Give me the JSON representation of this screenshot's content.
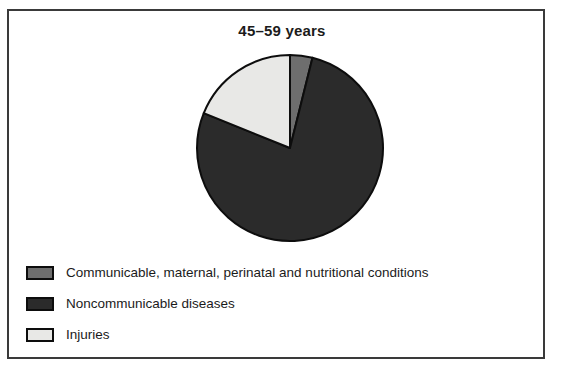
{
  "figure": {
    "title": "45–59 years",
    "frame_color": "#3a3a3a",
    "background": "#ffffff"
  },
  "legend": {
    "items": [
      {
        "label": "Communicable, maternal, perinatal and nutritional conditions",
        "swatch_name": "legend-swatch-communicable",
        "color": "#6e6e6e"
      },
      {
        "label": "Noncommunicable diseases",
        "swatch_name": "legend-swatch-noncommunicable",
        "color": "#2b2b2b"
      },
      {
        "label": "Injuries",
        "swatch_name": "legend-swatch-injuries",
        "color": "#e8e8e6"
      }
    ]
  },
  "chart_data": {
    "type": "pie",
    "title": "45–59 years",
    "xlabel": "",
    "ylabel": "",
    "start_angle_deg": 0,
    "direction": "clockwise",
    "legend_position": "bottom-left",
    "grid": false,
    "categories": [
      "Communicable, maternal, perinatal and nutritional conditions",
      "Noncommunicable diseases",
      "Injuries"
    ],
    "values": [
      4,
      77,
      19
    ],
    "unit": "percent",
    "colors": [
      "#6e6e6e",
      "#2b2b2b",
      "#e8e8e6"
    ],
    "slices": [
      {
        "name": "Communicable, maternal, perinatal and nutritional conditions",
        "value": 4,
        "color": "#6e6e6e",
        "start_deg": 0,
        "end_deg": 14
      },
      {
        "name": "Noncommunicable diseases",
        "value": 77,
        "color": "#2b2b2b",
        "start_deg": 14,
        "end_deg": 292
      },
      {
        "name": "Injuries",
        "value": 19,
        "color": "#e8e8e6",
        "start_deg": 292,
        "end_deg": 360
      }
    ]
  }
}
